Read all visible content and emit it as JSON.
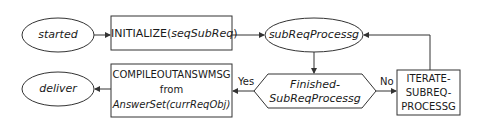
{
  "diagram": {
    "type": "flowchart",
    "nodes": {
      "started": {
        "shape": "ellipse",
        "label": "started"
      },
      "initialize": {
        "shape": "rectangle",
        "label_plain": "INITIALIZE(",
        "label_italic": "seqSubReq",
        "label_end": ")"
      },
      "subReqProcessg": {
        "shape": "ellipse",
        "label": "subReqProcessg"
      },
      "finished": {
        "shape": "hexagon",
        "line1": "Finished-",
        "line2": "SubReqProcessg"
      },
      "iterate": {
        "shape": "rectangle",
        "line1": "ITERATE-",
        "line2": "SUBREQ-",
        "line3": "PROCESSG"
      },
      "compile": {
        "shape": "rectangle",
        "line1": "COMPILEOUTANSWMSG",
        "line2": "from",
        "line3": "AnswerSet(currReqObj)"
      },
      "deliver": {
        "shape": "ellipse",
        "label": "deliver"
      }
    },
    "edges": [
      {
        "from": "started",
        "to": "initialize",
        "label": ""
      },
      {
        "from": "initialize",
        "to": "subReqProcessg",
        "label": ""
      },
      {
        "from": "subReqProcessg",
        "to": "finished",
        "label": ""
      },
      {
        "from": "finished",
        "to": "iterate",
        "label": "No"
      },
      {
        "from": "iterate",
        "to": "subReqProcessg",
        "label": ""
      },
      {
        "from": "finished",
        "to": "compile",
        "label": "Yes"
      },
      {
        "from": "compile",
        "to": "deliver",
        "label": ""
      }
    ],
    "edge_labels": {
      "yes": "Yes",
      "no": "No"
    },
    "colors": {
      "stroke": "#333333",
      "background": "#ffffff",
      "text": "#1a1a1a"
    }
  }
}
